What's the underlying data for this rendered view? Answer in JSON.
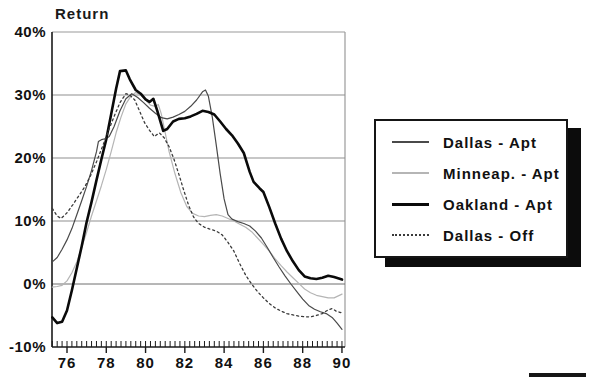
{
  "chart_data": {
    "type": "line",
    "title": "Return",
    "xlabel": "",
    "ylabel": "Return",
    "ylim": [
      -10,
      40
    ],
    "x_range": [
      75.25,
      90
    ],
    "grid": true,
    "legend_position": "right",
    "yticks": {
      "values": [
        40,
        30,
        20,
        10,
        0,
        -10
      ],
      "labels": [
        "40%",
        "30%",
        "20%",
        "10%",
        "0%",
        "-10%"
      ]
    },
    "xticks": {
      "major_values": [
        76,
        78,
        80,
        82,
        84,
        86,
        88,
        90
      ],
      "major_labels": [
        "76",
        "78",
        "80",
        "82",
        "84",
        "86",
        "88",
        "90"
      ],
      "minor_step": 0.25
    },
    "colors": {
      "axis": "#1a1a1a",
      "grid": "#8f8f8f",
      "zero_line": "#6e6e6e",
      "frame": "#9a9a9a"
    },
    "draw_order": [
      1,
      0,
      2,
      3
    ],
    "series": [
      {
        "name": "Dallas - Apt",
        "color": "#4a4a4a",
        "width": 1.2,
        "dash": "",
        "points": [
          [
            75.25,
            3.5
          ],
          [
            75.5,
            4.2
          ],
          [
            75.75,
            5.5
          ],
          [
            76,
            7
          ],
          [
            76.25,
            8.8
          ],
          [
            76.5,
            11
          ],
          [
            76.75,
            13.2
          ],
          [
            77,
            15.5
          ],
          [
            77.25,
            18
          ],
          [
            77.5,
            21
          ],
          [
            77.6,
            22.6
          ],
          [
            77.75,
            22.9
          ],
          [
            78,
            23.1
          ],
          [
            78.15,
            23.4
          ],
          [
            78.4,
            25
          ],
          [
            78.7,
            27.5
          ],
          [
            79,
            29.4
          ],
          [
            79.3,
            30.2
          ],
          [
            79.6,
            29.6
          ],
          [
            79.9,
            28.8
          ],
          [
            80.2,
            27.9
          ],
          [
            80.5,
            27.1
          ],
          [
            80.8,
            26.4
          ],
          [
            81.1,
            26.2
          ],
          [
            81.4,
            26.5
          ],
          [
            81.7,
            26.9
          ],
          [
            82,
            27.4
          ],
          [
            82.3,
            28.2
          ],
          [
            82.6,
            29.2
          ],
          [
            82.9,
            30.5
          ],
          [
            83.05,
            30.8
          ],
          [
            83.2,
            29.8
          ],
          [
            83.4,
            26.5
          ],
          [
            83.6,
            22
          ],
          [
            83.8,
            17.5
          ],
          [
            84,
            13.5
          ],
          [
            84.2,
            11
          ],
          [
            84.4,
            10.3
          ],
          [
            84.7,
            9.9
          ],
          [
            85,
            9.6
          ],
          [
            85.3,
            9.2
          ],
          [
            85.6,
            8.4
          ],
          [
            85.9,
            7.3
          ],
          [
            86.2,
            5.8
          ],
          [
            86.5,
            4.2
          ],
          [
            86.8,
            2.7
          ],
          [
            87.1,
            1.3
          ],
          [
            87.4,
            0
          ],
          [
            87.7,
            -1.2
          ],
          [
            88,
            -2.4
          ],
          [
            88.3,
            -3.4
          ],
          [
            88.6,
            -4
          ],
          [
            88.9,
            -4.4
          ],
          [
            89.2,
            -4.7
          ],
          [
            89.5,
            -5.3
          ],
          [
            89.75,
            -6.2
          ],
          [
            90,
            -7.2
          ]
        ]
      },
      {
        "name": "Minneap. - Apt",
        "color": "#b5b5b5",
        "width": 1.2,
        "dash": "",
        "points": [
          [
            75.25,
            -0.5
          ],
          [
            75.5,
            -0.4
          ],
          [
            75.75,
            -0.2
          ],
          [
            76,
            0.5
          ],
          [
            76.25,
            1.8
          ],
          [
            76.5,
            3.5
          ],
          [
            76.75,
            5.8
          ],
          [
            77,
            8.2
          ],
          [
            77.25,
            10.8
          ],
          [
            77.5,
            13.2
          ],
          [
            77.75,
            15.6
          ],
          [
            78,
            18.2
          ],
          [
            78.25,
            21
          ],
          [
            78.5,
            24
          ],
          [
            78.75,
            26.5
          ],
          [
            79,
            28.6
          ],
          [
            79.25,
            29.8
          ],
          [
            79.5,
            30.4
          ],
          [
            79.75,
            30
          ],
          [
            80,
            29.2
          ],
          [
            80.25,
            28.4
          ],
          [
            80.5,
            28.2
          ],
          [
            80.65,
            28.5
          ],
          [
            80.8,
            27
          ],
          [
            81,
            24
          ],
          [
            81.2,
            21
          ],
          [
            81.5,
            17.5
          ],
          [
            81.8,
            14.5
          ],
          [
            82.1,
            12.3
          ],
          [
            82.4,
            11.2
          ],
          [
            82.7,
            10.8
          ],
          [
            83,
            10.7
          ],
          [
            83.3,
            10.9
          ],
          [
            83.6,
            11
          ],
          [
            83.9,
            10.8
          ],
          [
            84.2,
            10.4
          ],
          [
            84.5,
            10
          ],
          [
            84.8,
            9.5
          ],
          [
            85.1,
            9
          ],
          [
            85.4,
            8.3
          ],
          [
            85.7,
            7.3
          ],
          [
            86,
            6.3
          ],
          [
            86.3,
            5.2
          ],
          [
            86.6,
            4
          ],
          [
            86.9,
            2.9
          ],
          [
            87.2,
            1.9
          ],
          [
            87.5,
            1
          ],
          [
            87.8,
            0.1
          ],
          [
            88.1,
            -0.8
          ],
          [
            88.4,
            -1.4
          ],
          [
            88.7,
            -1.8
          ],
          [
            89,
            -2
          ],
          [
            89.3,
            -2.2
          ],
          [
            89.6,
            -2.2
          ],
          [
            90,
            -1.6
          ]
        ]
      },
      {
        "name": "Oakland - Apt",
        "color": "#0a0a0a",
        "width": 2.6,
        "dash": "",
        "points": [
          [
            75.25,
            -5.3
          ],
          [
            75.5,
            -6.2
          ],
          [
            75.75,
            -6
          ],
          [
            76,
            -4.2
          ],
          [
            76.25,
            -1
          ],
          [
            76.5,
            2.5
          ],
          [
            76.75,
            6
          ],
          [
            77,
            9.8
          ],
          [
            77.25,
            13
          ],
          [
            77.5,
            16.5
          ],
          [
            77.75,
            19.8
          ],
          [
            78,
            23
          ],
          [
            78.25,
            27
          ],
          [
            78.5,
            31
          ],
          [
            78.7,
            33.8
          ],
          [
            79,
            33.9
          ],
          [
            79.2,
            32.5
          ],
          [
            79.5,
            30.8
          ],
          [
            79.75,
            30.2
          ],
          [
            80,
            29.3
          ],
          [
            80.2,
            28.9
          ],
          [
            80.4,
            29.4
          ],
          [
            80.6,
            27.5
          ],
          [
            80.9,
            24.3
          ],
          [
            81.1,
            24.6
          ],
          [
            81.4,
            25.8
          ],
          [
            81.7,
            26.2
          ],
          [
            82,
            26.3
          ],
          [
            82.3,
            26.6
          ],
          [
            82.6,
            27
          ],
          [
            82.9,
            27.5
          ],
          [
            83.2,
            27.3
          ],
          [
            83.5,
            26.9
          ],
          [
            83.8,
            25.8
          ],
          [
            84.1,
            24.6
          ],
          [
            84.4,
            23.6
          ],
          [
            84.7,
            22.3
          ],
          [
            85,
            20.8
          ],
          [
            85.3,
            17.8
          ],
          [
            85.5,
            16.2
          ],
          [
            85.8,
            15.2
          ],
          [
            86,
            14.6
          ],
          [
            86.3,
            12.2
          ],
          [
            86.6,
            9.6
          ],
          [
            86.9,
            7.2
          ],
          [
            87.2,
            5.2
          ],
          [
            87.5,
            3.6
          ],
          [
            87.8,
            2.2
          ],
          [
            88.1,
            1.2
          ],
          [
            88.4,
            0.9
          ],
          [
            88.7,
            0.8
          ],
          [
            89,
            1
          ],
          [
            89.3,
            1.3
          ],
          [
            89.6,
            1.1
          ],
          [
            90,
            0.7
          ]
        ]
      },
      {
        "name": "Dallas - Off",
        "color": "#3a3a3a",
        "width": 1.3,
        "dash": "2 3",
        "points": [
          [
            75.25,
            12
          ],
          [
            75.5,
            10.8
          ],
          [
            75.7,
            10.4
          ],
          [
            76,
            11.3
          ],
          [
            76.3,
            12.6
          ],
          [
            76.6,
            14
          ],
          [
            76.9,
            15.4
          ],
          [
            77.2,
            17.2
          ],
          [
            77.5,
            19.4
          ],
          [
            77.8,
            21.8
          ],
          [
            78.1,
            24.2
          ],
          [
            78.4,
            26.6
          ],
          [
            78.7,
            28.8
          ],
          [
            79,
            30.2
          ],
          [
            79.2,
            30
          ],
          [
            79.45,
            29.2
          ],
          [
            79.7,
            27.4
          ],
          [
            79.95,
            25.6
          ],
          [
            80.2,
            24.4
          ],
          [
            80.45,
            23.4
          ],
          [
            80.7,
            24
          ],
          [
            80.95,
            23.2
          ],
          [
            81.2,
            21.8
          ],
          [
            81.45,
            19.8
          ],
          [
            81.7,
            17.4
          ],
          [
            81.95,
            14.8
          ],
          [
            82.2,
            12.4
          ],
          [
            82.45,
            10.6
          ],
          [
            82.7,
            9.6
          ],
          [
            83,
            9
          ],
          [
            83.3,
            8.7
          ],
          [
            83.6,
            8.4
          ],
          [
            83.9,
            7.8
          ],
          [
            84.2,
            6.6
          ],
          [
            84.5,
            5.2
          ],
          [
            84.8,
            3.2
          ],
          [
            85.1,
            1.4
          ],
          [
            85.4,
            0
          ],
          [
            85.7,
            -1.2
          ],
          [
            86,
            -2.2
          ],
          [
            86.3,
            -3.1
          ],
          [
            86.6,
            -3.8
          ],
          [
            86.9,
            -4.3
          ],
          [
            87.2,
            -4.7
          ],
          [
            87.5,
            -4.9
          ],
          [
            87.8,
            -5.1
          ],
          [
            88.1,
            -5.2
          ],
          [
            88.4,
            -5.2
          ],
          [
            88.7,
            -5
          ],
          [
            89,
            -4.7
          ],
          [
            89.3,
            -4.1
          ],
          [
            89.5,
            -3.9
          ],
          [
            89.7,
            -4.3
          ],
          [
            90,
            -4.6
          ]
        ]
      }
    ]
  },
  "legend": {
    "items": [
      {
        "label": "Dallas - Apt"
      },
      {
        "label": "Minneap. - Apt"
      },
      {
        "label": "Oakland - Apt"
      },
      {
        "label": "Dallas - Off"
      }
    ]
  },
  "decor": {
    "footer_bar": true
  }
}
